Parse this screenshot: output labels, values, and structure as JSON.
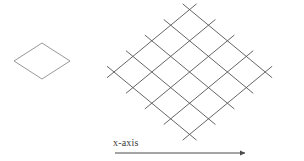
{
  "figure": {
    "background_color": "#ffffff",
    "unit_cell": {
      "label_name": "unit-cell-diamond",
      "stroke_color": "#8c8c8c",
      "stroke_width": 0.9,
      "center_x": 42,
      "center_y": 61,
      "half_width": 28,
      "half_height": 18
    },
    "lattice": {
      "label_name": "lattice-grid",
      "stroke_color": "#555555",
      "stroke_width": 0.9,
      "rows": 4,
      "cols": 4,
      "line_count_per_direction": 5,
      "origin_x": 114,
      "origin_y": 72,
      "step_x": 37.8,
      "step_y": 15.6,
      "overhang": 9,
      "top_apex_x": 190,
      "top_apex_y": 10,
      "bottom_apex_x": 192,
      "bottom_apex_y": 135,
      "left_extreme_x": 114,
      "left_extreme_y": 72,
      "right_extreme_x": 265,
      "right_extreme_y": 72
    },
    "x_axis": {
      "label": "x-axis",
      "label_x": 113,
      "label_y": 137,
      "line_color": "#4a4a4a",
      "line_width": 1.1,
      "start_x": 115,
      "end_x": 245,
      "y": 153,
      "arrowhead": "solid-triangle"
    }
  },
  "chart_data": {
    "type": "diagram",
    "title": "",
    "xlabel": "x-axis",
    "ylabel": "",
    "elements": [
      {
        "name": "unit cell",
        "shape": "rhombus",
        "count": 1,
        "vertices": [
          [
            14,
            61
          ],
          [
            42,
            43
          ],
          [
            70,
            61
          ],
          [
            42,
            79
          ]
        ]
      },
      {
        "name": "lattice array",
        "shape": "rhombic tiling",
        "rows": 4,
        "cols": 4,
        "cells": 16,
        "lines_direction_a": 5,
        "lines_direction_b": 5
      },
      {
        "name": "x-axis arrow",
        "shape": "arrow",
        "from": [
          115,
          153
        ],
        "to": [
          245,
          153
        ],
        "label": "x-axis"
      }
    ]
  }
}
